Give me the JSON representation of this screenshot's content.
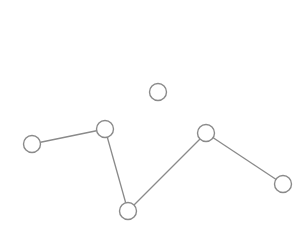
{
  "diagram": {
    "type": "graph",
    "colors": {
      "background": "#ffffff",
      "stroke": "#8a8a8a",
      "node_fill": "#ffffff"
    },
    "nodes": [
      {
        "id": "n1",
        "x": 32,
        "y": 144,
        "r": 8.5
      },
      {
        "id": "n2",
        "x": 105,
        "y": 129,
        "r": 8.5
      },
      {
        "id": "n3",
        "x": 128,
        "y": 211,
        "r": 8.5
      },
      {
        "id": "n4",
        "x": 206,
        "y": 133,
        "r": 8.5
      },
      {
        "id": "n5",
        "x": 283,
        "y": 184,
        "r": 8.5
      },
      {
        "id": "n6",
        "x": 158,
        "y": 92,
        "r": 8.5
      }
    ],
    "edges": [
      {
        "from": "n1",
        "to": "n2"
      },
      {
        "from": "n2",
        "to": "n3"
      },
      {
        "from": "n3",
        "to": "n4"
      },
      {
        "from": "n4",
        "to": "n5"
      }
    ]
  }
}
